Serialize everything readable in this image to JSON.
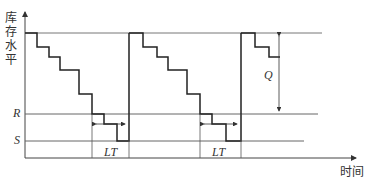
{
  "diagram": {
    "type": "inventory-level-vs-time (periodic replenishment, reorder point)",
    "y_axis_label_chars": [
      "库",
      "存",
      "水",
      "平"
    ],
    "y_axis_label": "库存水平",
    "x_axis_label": "时间",
    "levels": {
      "R": "R",
      "S": "S"
    },
    "annotations": {
      "order_quantity": "Q",
      "lead_time": "LT",
      "lead_time_2": "LT"
    },
    "cycles": 3,
    "colors": {
      "line": "#333333",
      "stair": "#222222",
      "text": "#333333",
      "background": "#ffffff"
    }
  }
}
